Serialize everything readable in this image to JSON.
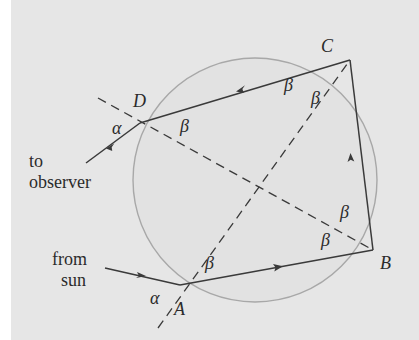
{
  "diagram": {
    "type": "ray-optics",
    "colors": {
      "background": "#e6e6e6",
      "circle": "#a8a8a8",
      "ray": "#3a3a3a",
      "normal": "#3a3a3a"
    },
    "points": {
      "A": {
        "label": "A",
        "x": 180,
        "y": 285
      },
      "B": {
        "label": "B",
        "x": 373,
        "y": 250
      },
      "C": {
        "label": "C",
        "x": 350,
        "y": 60
      },
      "D": {
        "label": "D",
        "x": 140,
        "y": 123
      }
    },
    "angle_labels": {
      "alpha_A": "α",
      "alpha_D": "α",
      "beta_A": "β",
      "beta_B1": "β",
      "beta_B2": "β",
      "beta_C1": "β",
      "beta_C2": "β",
      "beta_D": "β"
    },
    "text": {
      "to_observer_1": "to",
      "to_observer_2": "observer",
      "from_sun_1": "from",
      "from_sun_2": "sun"
    }
  }
}
